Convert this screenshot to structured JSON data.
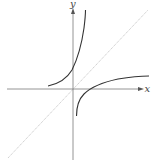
{
  "diagram": {
    "type": "function-inverse-reflection",
    "axes": {
      "x_label": "x",
      "y_label": "y"
    },
    "elements": [
      {
        "name": "x-axis",
        "description": "horizontal axis with arrow"
      },
      {
        "name": "y-axis",
        "description": "vertical axis with arrow"
      },
      {
        "name": "line-y-equals-x",
        "description": "diagonal reference line y = x"
      },
      {
        "name": "curve-upper-left",
        "description": "exponential-like curve in upper half, left of and crossing the y-axis"
      },
      {
        "name": "curve-lower-right",
        "description": "logarithmic-like curve, reflection of the upper curve across y = x"
      }
    ],
    "colors": {
      "axis": "#7a7a7a",
      "curve": "#333333",
      "diagonal": "#bdbdbd",
      "background": "#ffffff"
    }
  }
}
